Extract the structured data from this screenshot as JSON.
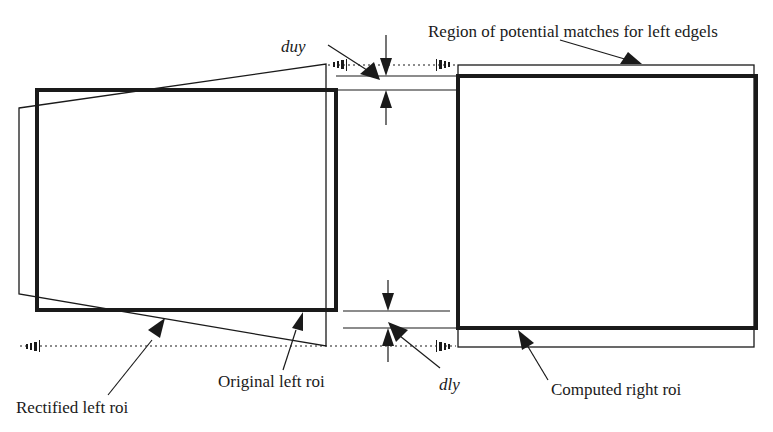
{
  "diagram": {
    "type": "stereo-roi-rectification",
    "colors": {
      "ink": "#1a1a1a",
      "background": "#ffffff"
    },
    "labels": {
      "region_matches": "Region of potential matches for left edgels",
      "duy": "duy",
      "dly": "dly",
      "original_left_roi": "Original left roi",
      "rectified_left_roi": "Rectified left roi",
      "computed_right_roi": "Computed right roi"
    },
    "shapes": {
      "original_left_roi": {
        "x": 37,
        "y": 90,
        "w": 299,
        "h": 220,
        "stroke": "thick"
      },
      "rectified_left_roi": {
        "points": [
          [
            19,
            108
          ],
          [
            326,
            64
          ],
          [
            326,
            346
          ],
          [
            19,
            294
          ]
        ],
        "stroke": "thin"
      },
      "computed_right_roi": {
        "x": 458,
        "y": 76,
        "w": 298,
        "h": 252,
        "stroke": "thick"
      },
      "region_of_potential_matches": {
        "x": 458,
        "y": 65,
        "w": 296,
        "h": 282,
        "stroke": "thin"
      }
    },
    "dimension_markers": [
      {
        "name": "duy",
        "y_top": 76,
        "y_bottom": 90
      },
      {
        "name": "dly",
        "y_top": 310,
        "y_bottom": 328
      }
    ]
  }
}
